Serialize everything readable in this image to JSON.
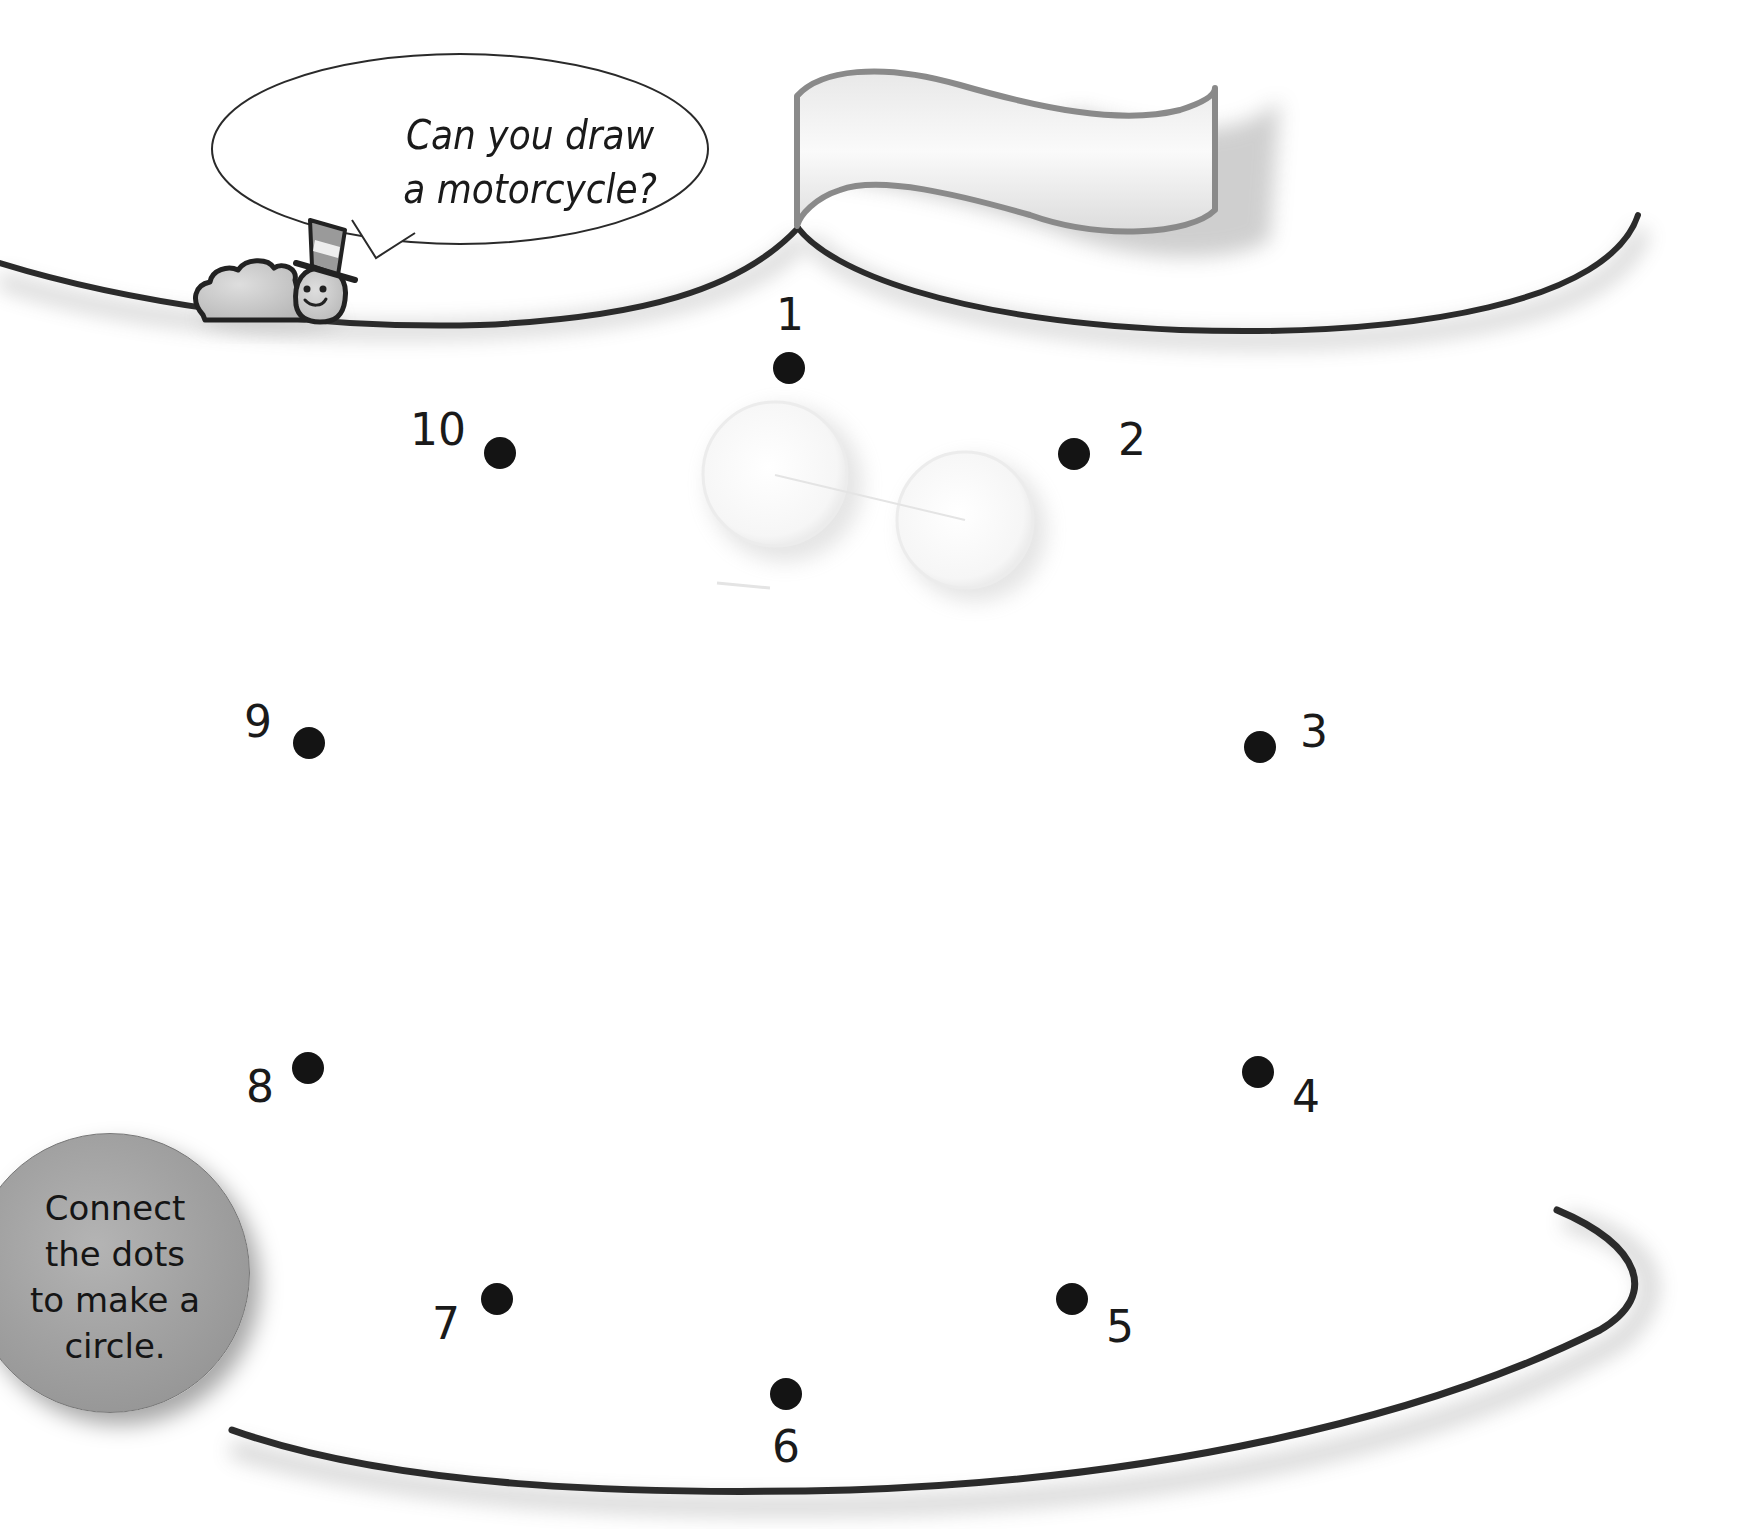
{
  "speech_bubble": {
    "line1": "Can you draw",
    "line2": "a motorcycle?"
  },
  "instruction_badge": {
    "line1": "Connect",
    "line2": "the dots",
    "line3": "to make a",
    "line4": "circle."
  },
  "flag": {
    "text": ""
  },
  "dots": [
    {
      "number": "1",
      "x": 789,
      "y": 368
    },
    {
      "number": "2",
      "x": 1074,
      "y": 454
    },
    {
      "number": "3",
      "x": 1260,
      "y": 747
    },
    {
      "number": "4",
      "x": 1258,
      "y": 1072
    },
    {
      "number": "5",
      "x": 1072,
      "y": 1299
    },
    {
      "number": "6",
      "x": 786,
      "y": 1394
    },
    {
      "number": "7",
      "x": 497,
      "y": 1299
    },
    {
      "number": "8",
      "x": 308,
      "y": 1068
    },
    {
      "number": "9",
      "x": 309,
      "y": 743
    },
    {
      "number": "10",
      "x": 500,
      "y": 453
    }
  ],
  "colors": {
    "ink": "#1a1a1a",
    "track_line": "#2b2b2b",
    "badge_fill": "#a2a2a2",
    "flag_border": "#8a8a8a",
    "background": "#ffffff"
  }
}
